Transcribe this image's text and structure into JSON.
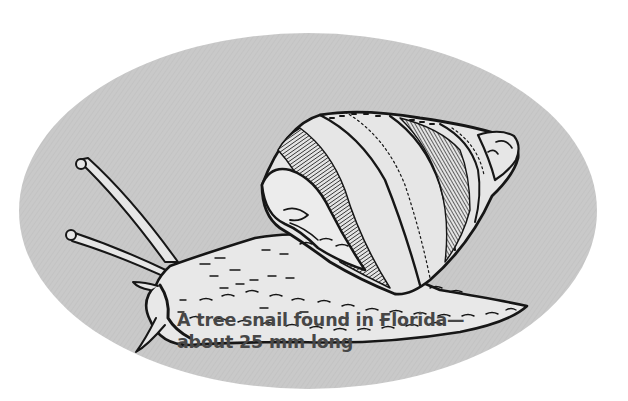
{
  "illustration": {
    "subject": "snail-line-drawing",
    "background_color": "#c9c9c9",
    "page_color": "#ffffff",
    "ink_color": "#161616"
  },
  "caption": {
    "line1": "A tree snail found in Florida—",
    "line2": "about 25 mm long",
    "color": "#474747"
  }
}
